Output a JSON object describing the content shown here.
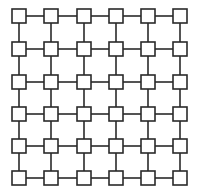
{
  "diagram": {
    "type": "mesh-grid",
    "rows": 6,
    "cols": 6,
    "node_shape": "square",
    "node_size": 14,
    "col_x": [
      19,
      51,
      84,
      116,
      148,
      180
    ],
    "row_y": [
      16,
      49,
      82,
      114,
      146,
      178
    ],
    "colors": {
      "background": "#ffffff",
      "node_fill": "#ffffff",
      "node_stroke": "#2a2a2a",
      "edge": "#2a2a2a"
    },
    "stroke_width": 1.6
  }
}
